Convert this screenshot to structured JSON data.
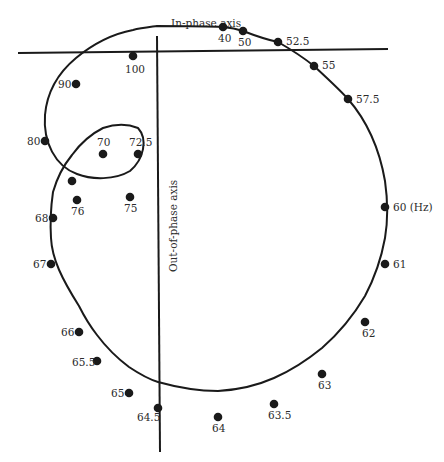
{
  "diagram": {
    "in_phase_axis_label": "In-phase axis",
    "out_of_phase_axis_label": "Out-of-phase axis",
    "unit": "Hz",
    "colors": {
      "curve": "#1a1a1a",
      "axis": "#1a1a1a",
      "point": "#1a1a1a",
      "text": "#2b2b2b",
      "background": "#ffffff"
    },
    "points": [
      {
        "label": "40",
        "x": 223,
        "y": 27,
        "lx": 218,
        "ly": 42,
        "anchor": "start"
      },
      {
        "label": "50",
        "x": 243,
        "y": 31,
        "lx": 238,
        "ly": 46,
        "anchor": "start"
      },
      {
        "label": "52.5",
        "x": 278,
        "y": 42,
        "lx": 286,
        "ly": 45,
        "anchor": "start"
      },
      {
        "label": "55",
        "x": 314,
        "y": 66,
        "lx": 322,
        "ly": 69,
        "anchor": "start"
      },
      {
        "label": "57.5",
        "x": 348,
        "y": 99,
        "lx": 356,
        "ly": 103,
        "anchor": "start"
      },
      {
        "label": "60 (Hz)",
        "x": 385,
        "y": 207,
        "lx": 393,
        "ly": 211,
        "anchor": "start"
      },
      {
        "label": "61",
        "x": 385,
        "y": 264,
        "lx": 393,
        "ly": 268,
        "anchor": "start"
      },
      {
        "label": "62",
        "x": 365,
        "y": 322,
        "lx": 362,
        "ly": 337,
        "anchor": "start"
      },
      {
        "label": "63",
        "x": 322,
        "y": 374,
        "lx": 318,
        "ly": 389,
        "anchor": "start"
      },
      {
        "label": "63.5",
        "x": 274,
        "y": 404,
        "lx": 268,
        "ly": 419,
        "anchor": "start"
      },
      {
        "label": "64",
        "x": 218,
        "y": 417,
        "lx": 212,
        "ly": 432,
        "anchor": "start"
      },
      {
        "label": "64.5",
        "x": 158,
        "y": 408,
        "lx": 137,
        "ly": 421,
        "anchor": "start"
      },
      {
        "label": "65",
        "x": 129,
        "y": 393,
        "lx": 111,
        "ly": 397,
        "anchor": "start"
      },
      {
        "label": "65.5",
        "x": 97,
        "y": 361,
        "lx": 72,
        "ly": 366,
        "anchor": "start"
      },
      {
        "label": "66",
        "x": 79,
        "y": 332,
        "lx": 61,
        "ly": 336,
        "anchor": "start"
      },
      {
        "label": "67",
        "x": 51,
        "y": 264,
        "lx": 33,
        "ly": 268,
        "anchor": "start"
      },
      {
        "label": "68",
        "x": 53,
        "y": 218,
        "lx": 35,
        "ly": 222,
        "anchor": "start"
      },
      {
        "label": "",
        "x": 72,
        "y": 181,
        "lx": 0,
        "ly": 0,
        "anchor": "start"
      },
      {
        "label": "70",
        "x": 103,
        "y": 154,
        "lx": 97,
        "ly": 146,
        "anchor": "start"
      },
      {
        "label": "72.5",
        "x": 138,
        "y": 154,
        "lx": 129,
        "ly": 146,
        "anchor": "start"
      },
      {
        "label": "75",
        "x": 130,
        "y": 197,
        "lx": 124,
        "ly": 212,
        "anchor": "start"
      },
      {
        "label": "76",
        "x": 77,
        "y": 200,
        "lx": 71,
        "ly": 215,
        "anchor": "start"
      },
      {
        "label": "80",
        "x": 45,
        "y": 141,
        "lx": 27,
        "ly": 145,
        "anchor": "start"
      },
      {
        "label": "90",
        "x": 76,
        "y": 84,
        "lx": 58,
        "ly": 88,
        "anchor": "start"
      },
      {
        "label": "100",
        "x": 133,
        "y": 56,
        "lx": 125,
        "ly": 73,
        "anchor": "start"
      }
    ]
  }
}
